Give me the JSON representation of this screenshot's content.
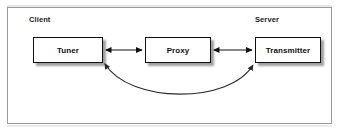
{
  "figure": {
    "caption_zones": [
      {
        "name": "client",
        "label": "Client"
      },
      {
        "name": "server",
        "label": "Server"
      }
    ],
    "nodes": [
      {
        "name": "tuner",
        "label": "Tuner"
      },
      {
        "name": "proxy",
        "label": "Proxy"
      },
      {
        "name": "transmitter",
        "label": "Transmitter"
      }
    ],
    "connectors": [
      {
        "name": "tuner-proxy-link",
        "from": "Tuner",
        "to": "Proxy",
        "style": "straight",
        "arrowheads": "both",
        "color": "#111111"
      },
      {
        "name": "proxy-transmitter-link",
        "from": "Proxy",
        "to": "Transmitter",
        "style": "straight",
        "arrowheads": "both",
        "color": "#111111"
      },
      {
        "name": "tuner-transmitter-bypass-link",
        "from": "Tuner",
        "to": "Transmitter",
        "style": "curved",
        "arrowheads": "both",
        "color": "#333333"
      }
    ]
  },
  "colors": {
    "background": "#ffffff",
    "frame_border": "#9a9a9a",
    "box_border": "#111111",
    "text": "#111111",
    "connector": "#111111"
  }
}
